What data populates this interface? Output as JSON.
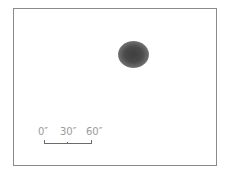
{
  "sketch": {
    "subject": "diffuse object",
    "scale_bar": {
      "labels": [
        "0″",
        "30″",
        "60″"
      ]
    }
  }
}
